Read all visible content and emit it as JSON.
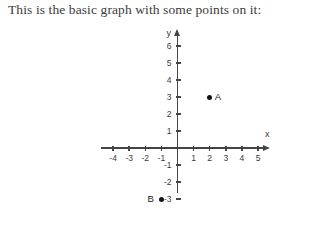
{
  "caption": "This is the basic graph with some points on it:",
  "chart_data": {
    "type": "scatter",
    "title": "",
    "xlabel": "x",
    "ylabel": "y",
    "xlim": [
      -4,
      5
    ],
    "ylim": [
      -3,
      6
    ],
    "grid": false,
    "legend": null,
    "x_ticks": [
      "-4",
      "-3",
      "-2",
      "-1",
      "1",
      "2",
      "3",
      "4",
      "5"
    ],
    "y_ticks": [
      "6",
      "5",
      "4",
      "3",
      "2",
      "1",
      "-1",
      "-2",
      "-3"
    ],
    "x_tick_values": [
      -4,
      -3,
      -2,
      -1,
      1,
      2,
      3,
      4,
      5
    ],
    "y_tick_values": [
      6,
      5,
      4,
      3,
      2,
      1,
      -1,
      -2,
      -3
    ],
    "points": [
      {
        "label": "A",
        "x": 2,
        "y": 3,
        "label_side": "right"
      },
      {
        "label": "B",
        "x": -1,
        "y": -3,
        "label_side": "left"
      }
    ],
    "axis_colors": {
      "axis": "#444444",
      "tick_text": "#3a3a3a",
      "point": "#141414"
    }
  }
}
